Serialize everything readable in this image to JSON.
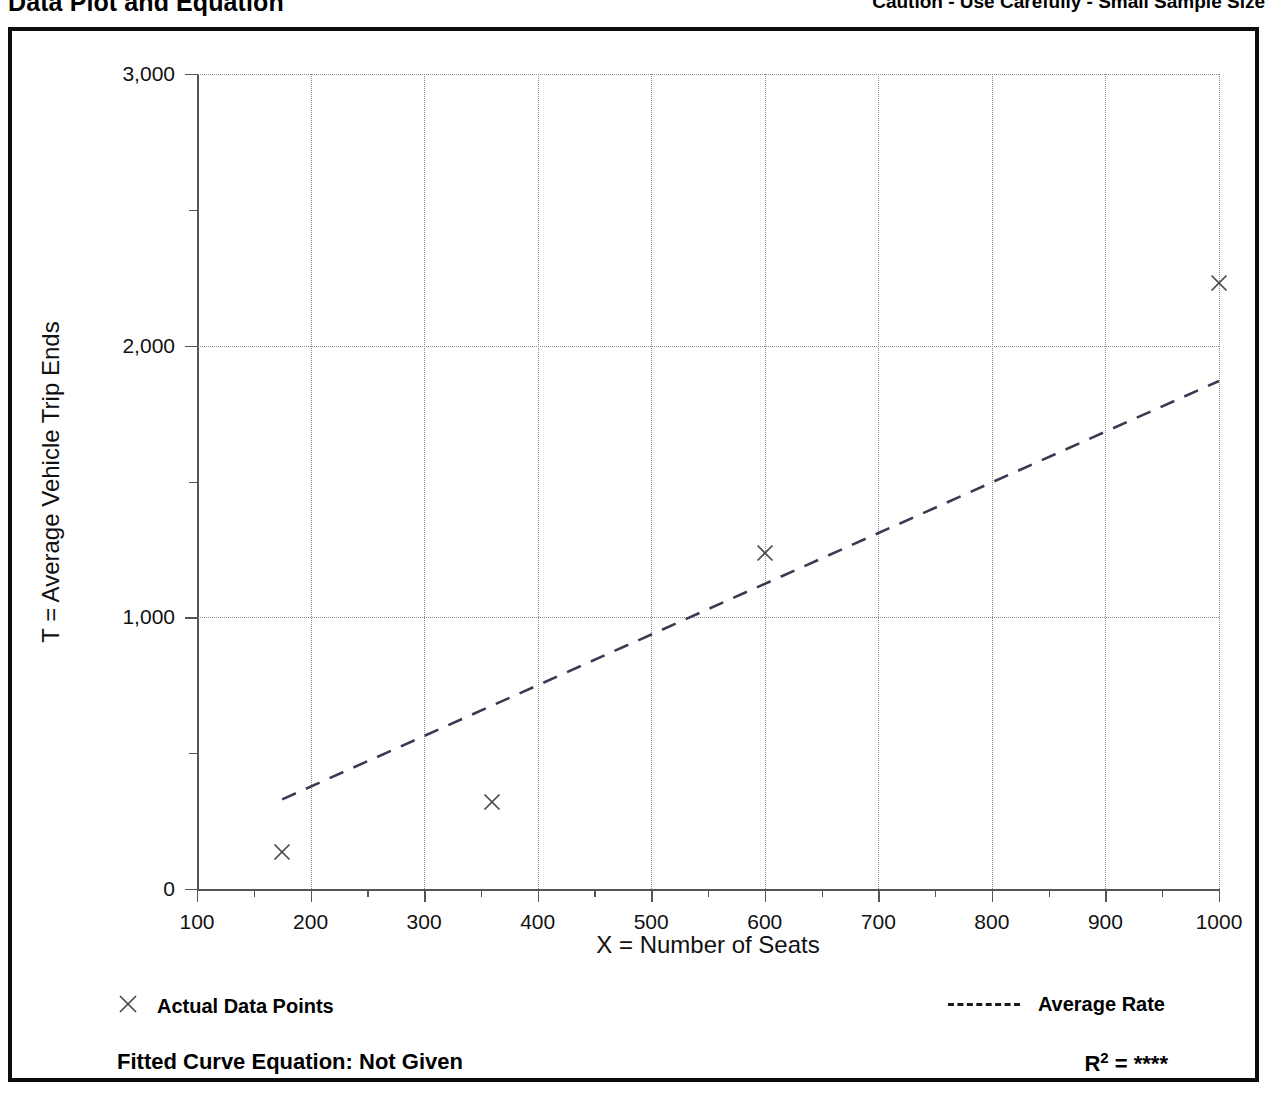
{
  "header": {
    "title": "Data Plot and Equation",
    "caution": "Caution - Use Carefully - Small Sample Size"
  },
  "legend": {
    "data_points_label": "Actual Data Points",
    "data_points_marker": "x-cross-marker",
    "average_rate_label": "Average Rate",
    "average_rate_marker": "dashed-line-sample"
  },
  "footer": {
    "fitted_equation_label": "Fitted Curve Equation:  Not Given",
    "r_squared_prefix": "R",
    "r_squared_exponent": "2",
    "r_squared_value": "= ****"
  },
  "colors": {
    "ink": "#000000",
    "frame": "#0d0d0d",
    "axis": "#555555",
    "grid": "#8a8a8a",
    "marker": "#4a4a4a",
    "trend": "#3a3a52"
  },
  "chart_data": {
    "type": "scatter",
    "title": "Data Plot and Equation",
    "xlabel": "X = Number of Seats",
    "ylabel": "T = Average Vehicle Trip Ends",
    "xlim": [
      100,
      1000
    ],
    "ylim": [
      0,
      3000
    ],
    "xticks": [
      100,
      200,
      300,
      400,
      500,
      600,
      700,
      800,
      900,
      1000
    ],
    "xtick_labels": [
      "100",
      "200",
      "300",
      "400",
      "500",
      "600",
      "700",
      "800",
      "900",
      "1000"
    ],
    "x_minor_ticks": [
      150,
      250,
      350,
      450,
      550,
      650,
      750,
      850,
      950
    ],
    "yticks": [
      0,
      1000,
      2000,
      3000
    ],
    "ytick_labels": [
      "0",
      "1,000",
      "2,000",
      "3,000"
    ],
    "y_minor_ticks": [
      500,
      1500,
      2500
    ],
    "grid": "dotted-at-major-ticks",
    "legend_position": "below-plot",
    "series": [
      {
        "name": "Actual Data Points",
        "type": "scatter",
        "marker": "x",
        "points": [
          {
            "x": 175,
            "y": 135
          },
          {
            "x": 360,
            "y": 320
          },
          {
            "x": 600,
            "y": 1235
          },
          {
            "x": 1000,
            "y": 2230
          }
        ]
      },
      {
        "name": "Average Rate",
        "type": "line",
        "style": "dashed",
        "points": [
          {
            "x": 175,
            "y": 330
          },
          {
            "x": 1000,
            "y": 1870
          }
        ]
      }
    ]
  }
}
